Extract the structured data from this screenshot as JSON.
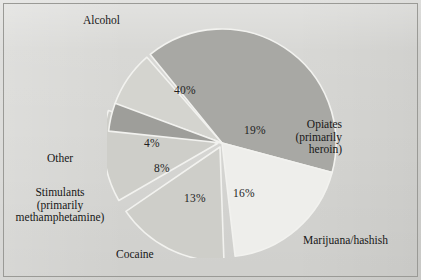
{
  "chart_data": {
    "type": "pie",
    "title": "",
    "subtitle": "",
    "xlabel": "",
    "ylabel": "",
    "legend_position": "callout-labels",
    "grid": false,
    "units": "percent",
    "total": 100,
    "categories": [
      "Alcohol",
      "Opiates (primarily heroin)",
      "Marijuana/hashish",
      "Cocaine",
      "Stimulants (primarily methamphetamine)",
      "Other"
    ],
    "values": [
      40,
      19,
      16,
      13,
      8,
      4
    ],
    "slices": [
      {
        "name": "Alcohol",
        "label_lines": [
          "Alcohol"
        ],
        "value": 40,
        "value_text": "40%",
        "color": "#a8a8a4",
        "start_angle_deg": 321,
        "sweep_deg": 144,
        "exploded": false,
        "label_align": "left",
        "label_pos": {
          "x": 83,
          "y": 14
        },
        "pct_pos": {
          "x": 174,
          "y": 84
        }
      },
      {
        "name": "Opiates (primarily heroin)",
        "label_lines": [
          "Opiates",
          "(primarily",
          "heroin)"
        ],
        "value": 19,
        "value_text": "19%",
        "color": "#eeeeeb",
        "start_angle_deg": 105,
        "sweep_deg": 68.4,
        "exploded": false,
        "label_align": "right",
        "label_pos": {
          "x": 342,
          "y": 118
        },
        "pct_pos": {
          "x": 244,
          "y": 124
        }
      },
      {
        "name": "Marijuana/hashish",
        "label_lines": [
          "Marijuana/hashish"
        ],
        "value": 16,
        "value_text": "16%",
        "color": "#cecec9",
        "start_angle_deg": 178,
        "sweep_deg": 57.6,
        "exploded": true,
        "label_align": "left",
        "label_pos": {
          "x": 303,
          "y": 234
        },
        "pct_pos": {
          "x": 233,
          "y": 187
        }
      },
      {
        "name": "Cocaine",
        "label_lines": [
          "Cocaine"
        ],
        "value": 13,
        "value_text": "13%",
        "color": "#cecec9",
        "start_angle_deg": 240,
        "sweep_deg": 46.8,
        "exploded": true,
        "label_align": "left",
        "label_pos": {
          "x": 116,
          "y": 248
        },
        "pct_pos": {
          "x": 184,
          "y": 192
        }
      },
      {
        "name": "Stimulants (primarily methamphetamine)",
        "label_lines": [
          "Stimulants",
          "(primarily",
          "methamphetamine)"
        ],
        "value": 8,
        "value_text": "8%",
        "color": "#d4d4cf",
        "start_angle_deg": 290,
        "sweep_deg": 28.8,
        "exploded": false,
        "label_align": "center",
        "label_pos": {
          "x": 60,
          "y": 186
        },
        "pct_pos": {
          "x": 154,
          "y": 162
        }
      },
      {
        "name": "Other",
        "label_lines": [
          "Other"
        ],
        "value": 4,
        "value_text": "4%",
        "color": "#9e9e9a",
        "start_angle_deg": 276,
        "sweep_deg": 14.4,
        "exploded": false,
        "label_align": "center",
        "label_pos": {
          "x": 60,
          "y": 152
        },
        "pct_pos": {
          "x": 144,
          "y": 137
        }
      }
    ]
  },
  "figure": {
    "background_color": "#d6d6d3",
    "border_color": "#9a9a96",
    "pie_divider_color": "#f2f2ef",
    "text_color": "#171717"
  }
}
